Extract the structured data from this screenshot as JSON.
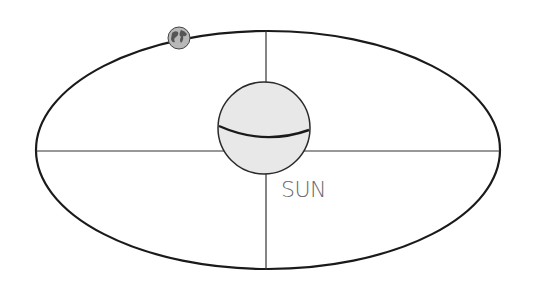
{
  "diagram": {
    "type": "orbit-ellipse",
    "labels": {
      "sun": "SUN"
    },
    "objects": [
      {
        "name": "sun",
        "shape": "circle"
      },
      {
        "name": "earth",
        "shape": "globe-icon"
      }
    ],
    "colors": {
      "stroke": "#1a1a1a",
      "sun_fill": "#e6e6e6",
      "label": "#6a6a6a",
      "earth_land": "#555555",
      "earth_water": "#b8b8b8"
    }
  }
}
